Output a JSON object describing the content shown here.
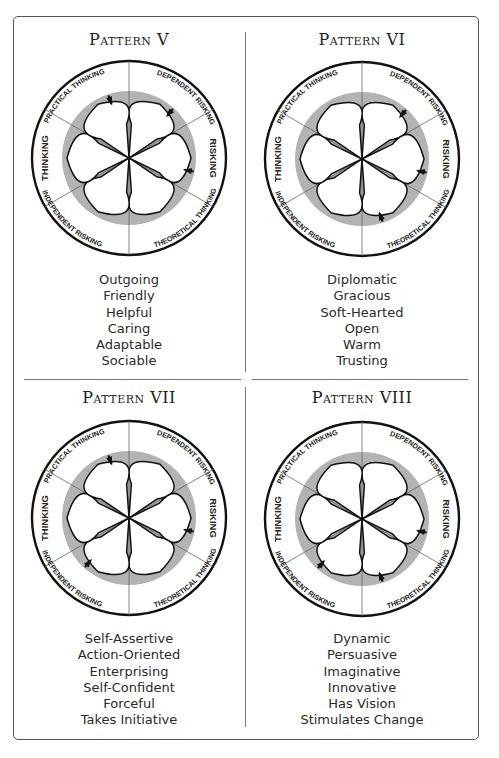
{
  "colors": {
    "frame": "#555555",
    "ring": "#111111",
    "gray_disk": "#b3b3b3",
    "petal_stroke": "#111111",
    "petal_fill": "#ffffff",
    "text": "#222222"
  },
  "wheel_labels": {
    "top_left": "PRACTICAL THINKING",
    "top_right": "DEPENDENT RISKING",
    "right": "RISKING",
    "bottom_right": "THEORETICAL THINKING",
    "bottom_left": "INDEPENDENT RISKING",
    "left": "THINKING"
  },
  "patterns": [
    {
      "title": "Pattern V",
      "arrows": [
        "top_left",
        "top_right",
        "right"
      ],
      "traits": [
        "Outgoing",
        "Friendly",
        "Helpful",
        "Caring",
        "Adaptable",
        "Sociable"
      ]
    },
    {
      "title": "Pattern VI",
      "arrows": [
        "top_right",
        "right",
        "bottom_right"
      ],
      "traits": [
        "Diplomatic",
        "Gracious",
        "Soft-Hearted",
        "Open",
        "Warm",
        "Trusting"
      ]
    },
    {
      "title": "Pattern VII",
      "arrows": [
        "top_left",
        "right",
        "bottom_left"
      ],
      "traits": [
        "Self-Assertive",
        "Action-Oriented",
        "Enterprising",
        "Self-Confident",
        "Forceful",
        "Takes Initiative"
      ]
    },
    {
      "title": "Pattern VIII",
      "arrows": [
        "right",
        "bottom_right",
        "bottom_left"
      ],
      "traits": [
        "Dynamic",
        "Persuasive",
        "Imaginative",
        "Innovative",
        "Has Vision",
        "Stimulates Change"
      ]
    }
  ]
}
